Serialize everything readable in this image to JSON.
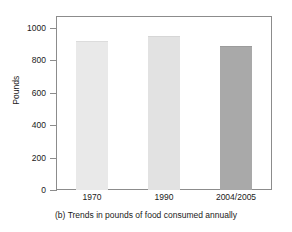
{
  "chart_data": {
    "type": "bar",
    "title": "",
    "caption": "(b) Trends in pounds of food consumed annually",
    "categories": [
      "1970",
      "1990",
      "2004/2005"
    ],
    "values": [
      920,
      950,
      890
    ],
    "series": [
      {
        "name": "Pounds of food consumed annually",
        "values": [
          920,
          950,
          890
        ]
      }
    ],
    "xlabel": "",
    "ylabel": "Pounds",
    "ylim": [
      0,
      1000
    ],
    "yticks": [
      0,
      200,
      400,
      600,
      800,
      1000
    ],
    "ytick_labels": [
      "0",
      "200",
      "400",
      "600",
      "800",
      "1000"
    ],
    "grid": false,
    "legend": false,
    "bar_colors": [
      "#e9e9e9",
      "#e2e2e2",
      "#a9a9a9"
    ],
    "bar_edge_colors": [
      "#dcdcdc",
      "#d6d6d6",
      "#9c9c9c"
    ],
    "frame_color": "#8c8c8c",
    "background": "#ffffff"
  }
}
